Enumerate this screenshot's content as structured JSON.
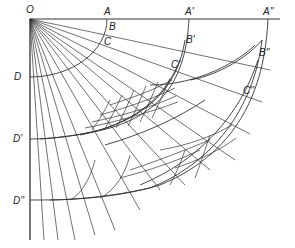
{
  "diagram": {
    "labels": {
      "O": "O",
      "A": "A",
      "A1": "A'",
      "A2": "A''",
      "B": "B",
      "B1": "B'",
      "B2": "B''",
      "C": "C",
      "C1": "C'",
      "C2": "C''",
      "D": "D",
      "D1": "D'",
      "D2": "D''"
    },
    "colors": {
      "line": "#333333",
      "background": "#ffffff"
    }
  }
}
